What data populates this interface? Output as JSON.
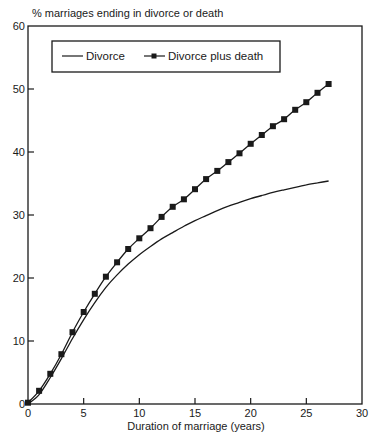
{
  "chart_data": {
    "type": "line",
    "title": "",
    "ylabel": "% marriages ending in divorce or death",
    "xlabel": "Duration of marriage (years)",
    "xlim": [
      0,
      30
    ],
    "ylim": [
      0,
      60
    ],
    "xticks": [
      0,
      5,
      10,
      15,
      20,
      25,
      30
    ],
    "yticks": [
      0,
      10,
      20,
      30,
      40,
      50,
      60
    ],
    "grid": false,
    "legend_position": "top-left (inside plot, boxed)",
    "series": [
      {
        "name": "Divorce",
        "marker": "none",
        "x": [
          0,
          1,
          2,
          3,
          4,
          5,
          6,
          7,
          8,
          9,
          10,
          11,
          12,
          13,
          14,
          15,
          16,
          17,
          18,
          19,
          20,
          21,
          22,
          23,
          24,
          25,
          26,
          27
        ],
        "values": [
          0,
          1.5,
          4.2,
          7.2,
          10.4,
          13.4,
          16.1,
          18.5,
          20.5,
          22.2,
          23.7,
          25.0,
          26.2,
          27.2,
          28.2,
          29.1,
          29.9,
          30.7,
          31.4,
          32.0,
          32.6,
          33.1,
          33.6,
          34.0,
          34.4,
          34.8,
          35.1,
          35.4
        ]
      },
      {
        "name": "Divorce plus death",
        "marker": "square",
        "x": [
          0,
          1,
          2,
          3,
          4,
          5,
          6,
          7,
          8,
          9,
          10,
          11,
          12,
          13,
          14,
          15,
          16,
          17,
          18,
          19,
          20,
          21,
          22,
          23,
          24,
          25,
          26,
          27
        ],
        "values": [
          0.2,
          2.1,
          4.8,
          7.9,
          11.4,
          14.6,
          17.5,
          20.2,
          22.5,
          24.6,
          26.3,
          27.9,
          29.7,
          31.3,
          32.5,
          34.1,
          35.7,
          37.0,
          38.4,
          39.8,
          41.3,
          42.7,
          44.1,
          45.2,
          46.7,
          47.9,
          49.4,
          50.8
        ]
      }
    ]
  },
  "legend": {
    "items": [
      "Divorce",
      "Divorce plus death"
    ]
  },
  "colors": {
    "line": "#1a1a1a",
    "background": "#ffffff"
  }
}
